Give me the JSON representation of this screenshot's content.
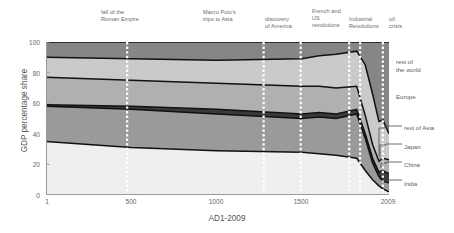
{
  "chart_data": {
    "type": "area",
    "stacked": true,
    "title": "",
    "xlabel": "AD1-2009",
    "ylabel": "GDP percentage share",
    "xlim": [
      1,
      2009
    ],
    "ylim": [
      0,
      100
    ],
    "yticks": [
      0,
      20,
      40,
      60,
      80,
      100
    ],
    "xticks": [
      1,
      500,
      1000,
      1500,
      2009
    ],
    "xtick_labels": [
      "1",
      "500",
      "1000",
      "1500",
      "2009"
    ],
    "ytick_labels": [
      "0",
      "20",
      "40",
      "60",
      "80",
      "100"
    ],
    "grid": false,
    "legend_position": "right-outside",
    "x": [
      1,
      500,
      1000,
      1500,
      1600,
      1700,
      1820,
      1870,
      1913,
      1950,
      1973,
      2009
    ],
    "series": [
      {
        "name": "India",
        "order": 1,
        "color": "#efefef",
        "values": [
          35,
          31,
          29,
          28,
          27,
          26,
          24,
          16,
          10,
          6,
          4,
          2
        ]
      },
      {
        "name": "China",
        "order": 2,
        "color": "#9a9a9a",
        "values": [
          23,
          25,
          24,
          22,
          24,
          24,
          29,
          21,
          11,
          6,
          5,
          6
        ]
      },
      {
        "name": "Japan",
        "order": 3,
        "color": "#3a3a3a",
        "values": [
          1,
          2,
          3,
          3,
          3,
          3,
          3,
          3,
          3,
          3,
          7,
          6
        ]
      },
      {
        "name": "rest of Asia",
        "order": 4,
        "color": "#b0b0b0",
        "values": [
          18,
          17,
          17,
          18,
          17,
          17,
          15,
          12,
          9,
          7,
          8,
          9
        ]
      },
      {
        "name": "Europe",
        "order": 5,
        "color": "#cacaca",
        "values": [
          13,
          14,
          15,
          18,
          20,
          22,
          23,
          33,
          33,
          26,
          25,
          17
        ]
      },
      {
        "name": "rest of the world",
        "order": 6,
        "color": "#868686",
        "values": [
          10,
          11,
          12,
          11,
          9,
          8,
          6,
          15,
          34,
          52,
          51,
          60
        ]
      }
    ],
    "events": [
      {
        "x": 476,
        "label": "fall of the\nRoman Empire"
      },
      {
        "x": 1275,
        "label": "Macro Polo's\ntrips to Asia"
      },
      {
        "x": 1492,
        "label": "discovery\nof America"
      },
      {
        "x": 1776,
        "label": "French and\nUS\nrevolutions"
      },
      {
        "x": 1840,
        "label": "Industrial\nRevolutions"
      },
      {
        "x": 1973,
        "label": "oil\ncrisis"
      }
    ],
    "legend_entries": [
      {
        "label": "rest of\nthe world",
        "series": "rest of the world"
      },
      {
        "label": "Europe",
        "series": "Europe"
      },
      {
        "label": "rest of Asia",
        "series": "rest of Asia"
      },
      {
        "label": "Japan",
        "series": "Japan"
      },
      {
        "label": "China",
        "series": "China"
      },
      {
        "label": "India",
        "series": "India"
      }
    ]
  }
}
